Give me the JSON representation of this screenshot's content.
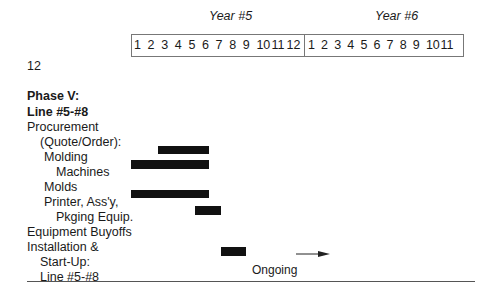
{
  "header": {
    "year5_label": "Year #5",
    "year6_label": "Year #6",
    "year5_months": [
      "1",
      "2",
      "3",
      "4",
      "5",
      "6",
      "7",
      "8",
      "9",
      "10",
      "11",
      "12"
    ],
    "year6_months": [
      "1",
      "2",
      "3",
      "4",
      "5",
      "6",
      "7",
      "8",
      "9",
      "10",
      "11"
    ],
    "overflow_month": "12"
  },
  "phase": {
    "title_line1": "Phase V:",
    "title_line2": "Line #5-#8"
  },
  "rows": [
    {
      "label": "Procurement"
    },
    {
      "label": "(Quote/Order):"
    },
    {
      "label": "Molding"
    },
    {
      "label": "Machines"
    },
    {
      "label": "Molds"
    },
    {
      "label": "Printer, Ass'y,"
    },
    {
      "label": "Pkging Equip."
    },
    {
      "label": "Equipment Buyoffs"
    },
    {
      "label": "Installation &"
    },
    {
      "label": "Start-Up:"
    },
    {
      "label": "Line #5-#8"
    }
  ],
  "annotations": {
    "ongoing": "Ongoing"
  },
  "chart_data": {
    "type": "gantt",
    "timeline": {
      "Year #5": "months 1-12",
      "Year #6": "months 1-11"
    },
    "tasks": [
      {
        "task": "Procurement (Quote/Order): Molding Machines (upper bar)",
        "start": "Y5 M3",
        "end": "Y5 M6"
      },
      {
        "task": "Molding Machines / Molds",
        "start": "Y5 M1",
        "end": "Y5 M6"
      },
      {
        "task": "Printer, Ass'y, Pkging Equip.",
        "start": "Y5 M1",
        "end": "Y5 M6"
      },
      {
        "task": "Pkging Equip. / Equipment Buyoffs",
        "start": "Y5 M6",
        "end": "Y5 M7"
      },
      {
        "task": "Installation & Start-Up: Line #5-#8",
        "start": "Y5 M8",
        "end": "Y5 M9",
        "continuation": "Ongoing"
      }
    ]
  }
}
